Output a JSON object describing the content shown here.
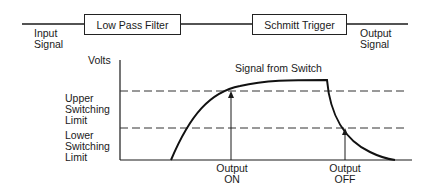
{
  "block_diagram": {
    "input_label": [
      "Input",
      "Signal"
    ],
    "blocks": [
      {
        "label": "Low Pass Filter"
      },
      {
        "label": "Schmitt Trigger"
      }
    ],
    "output_label": [
      "Output",
      "Signal"
    ]
  },
  "graph": {
    "y_axis_label": "Volts",
    "curve_label": "Signal from Switch",
    "thresholds": [
      {
        "label": [
          "Upper",
          "Switching",
          "Limit"
        ]
      },
      {
        "label": [
          "Lower",
          "Switching",
          "Limit"
        ]
      }
    ],
    "events": [
      {
        "label": [
          "Output",
          "ON"
        ]
      },
      {
        "label": [
          "Output",
          "OFF"
        ]
      }
    ]
  },
  "colors": {
    "line": "#1a1a1a",
    "background": "#ffffff"
  }
}
